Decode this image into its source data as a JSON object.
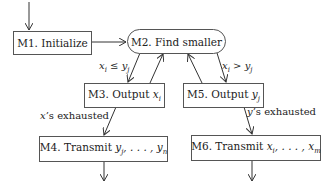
{
  "diagram": {
    "type": "flowchart",
    "nodes": [
      {
        "id": "M1",
        "label": "M1. Initialize",
        "shape": "rectangle"
      },
      {
        "id": "M2",
        "label": "M2. Find smaller",
        "shape": "rounded"
      },
      {
        "id": "M3",
        "label": "M3. Output",
        "math": "xi",
        "shape": "rectangle"
      },
      {
        "id": "M5",
        "label": "M5. Output",
        "math": "yj",
        "shape": "rectangle"
      },
      {
        "id": "M4",
        "label": "M4. Transmit",
        "math": "yj, ..., yn",
        "shape": "rectangle"
      },
      {
        "id": "M6",
        "label": "M6. Transmit",
        "math": "xi, ..., xm",
        "shape": "rectangle"
      }
    ],
    "edges": [
      {
        "from": "start",
        "to": "M1",
        "label": ""
      },
      {
        "from": "M1",
        "to": "M2",
        "label": ""
      },
      {
        "from": "M2",
        "to": "M3",
        "label": "xi ≤ yj"
      },
      {
        "from": "M3",
        "to": "M2",
        "label": ""
      },
      {
        "from": "M2",
        "to": "M5",
        "label": "xi > yj"
      },
      {
        "from": "M5",
        "to": "M2",
        "label": ""
      },
      {
        "from": "M3",
        "to": "M4",
        "label": "x's exhausted"
      },
      {
        "from": "M5",
        "to": "M6",
        "label": "y's exhausted"
      },
      {
        "from": "M4",
        "to": "end",
        "label": ""
      },
      {
        "from": "M6",
        "to": "end",
        "label": ""
      }
    ]
  },
  "text": {
    "m1": "M1. Initialize",
    "m2": "M2. Find smaller",
    "m3_prefix": "M3. Output ",
    "m3_var": "x",
    "m3_sub": "i",
    "m5_prefix": "M5. Output ",
    "m5_var": "y",
    "m5_sub": "j",
    "m4_prefix": "M4. Transmit ",
    "m4_math": "y",
    "m4_sub1": "j",
    "m4_mid": ", . . . , y",
    "m4_sub2": "n",
    "m6_prefix": "M6. Transmit ",
    "m6_math": "x",
    "m6_sub1": "i",
    "m6_mid": ", . . . , x",
    "m6_sub2": "m",
    "cond_le_a": "x",
    "cond_le_sub_a": "i",
    "cond_le_op": " ≤ ",
    "cond_le_b": "y",
    "cond_le_sub_b": "j",
    "cond_gt_a": "x",
    "cond_gt_sub_a": "i",
    "cond_gt_op": " > ",
    "cond_gt_b": "y",
    "cond_gt_sub_b": "j",
    "x_exhausted_var": "x",
    "x_exhausted": "’s exhausted",
    "y_exhausted_var": "y",
    "y_exhausted": "’s exhausted"
  }
}
